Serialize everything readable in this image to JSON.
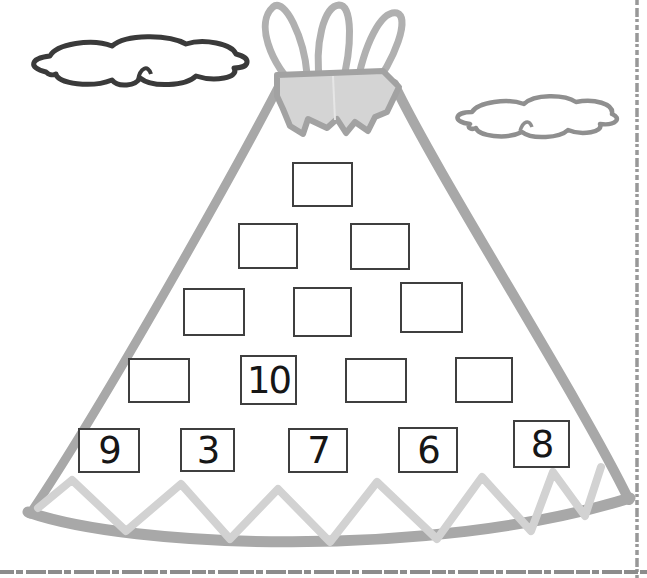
{
  "worksheet_type": "number-pyramid",
  "pyramid": {
    "rows": [
      [
        ""
      ],
      [
        "",
        ""
      ],
      [
        "",
        "",
        ""
      ],
      [
        "",
        "10",
        "",
        ""
      ],
      [
        "9",
        "3",
        "7",
        "6",
        "8"
      ]
    ]
  },
  "illustration": {
    "parts": [
      "teepee-outline",
      "teepee-poles",
      "teepee-top-flap",
      "zigzag-trim",
      "cloud-left",
      "cloud-right",
      "page-border-right",
      "page-border-bottom"
    ]
  },
  "colors": {
    "teepee_outline": "#a8a8a8",
    "flap_fill": "#d4d4d4",
    "flap_outline": "#a2a2a2",
    "zigzag": "#d2d2d2",
    "cloud_left_outline": "#3a3a3a",
    "cloud_right_outline": "#8f8f8f",
    "box_border": "#3f3f3f",
    "digit": "#161616",
    "page_border": "#909090"
  }
}
